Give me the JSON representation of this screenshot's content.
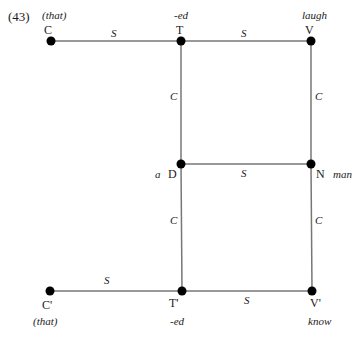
{
  "example_number": "(43)",
  "top_cutoff_text": "",
  "diagram": {
    "nodes": [
      {
        "id": "C",
        "label": "C",
        "word": "(that)",
        "x": 51,
        "y": 41
      },
      {
        "id": "T",
        "label": "T",
        "word": "-ed",
        "x": 181,
        "y": 41
      },
      {
        "id": "V",
        "label": "V",
        "word": "laugh",
        "x": 311,
        "y": 41
      },
      {
        "id": "D",
        "label": "D",
        "word": "a",
        "x": 181,
        "y": 164
      },
      {
        "id": "N",
        "label": "N",
        "word": "man",
        "x": 311,
        "y": 164
      },
      {
        "id": "C2",
        "label": "C'",
        "word": "(that)",
        "x": 50,
        "y": 291
      },
      {
        "id": "T2",
        "label": "T'",
        "word": "-ed",
        "x": 182,
        "y": 291
      },
      {
        "id": "V2",
        "label": "V'",
        "word": "know",
        "x": 312,
        "y": 291
      }
    ],
    "edges": [
      {
        "from": "C",
        "to": "T",
        "label": "S"
      },
      {
        "from": "T",
        "to": "V",
        "label": "S"
      },
      {
        "from": "T",
        "to": "D",
        "label": "C"
      },
      {
        "from": "V",
        "to": "N",
        "label": "C"
      },
      {
        "from": "D",
        "to": "N",
        "label": "S"
      },
      {
        "from": "D",
        "to": "T2",
        "label": "C"
      },
      {
        "from": "N",
        "to": "V2",
        "label": "C"
      },
      {
        "from": "C2",
        "to": "T2",
        "label": "S"
      },
      {
        "from": "T2",
        "to": "V2",
        "label": "S"
      }
    ]
  },
  "colors": {
    "line": "#777777",
    "node": "#000000",
    "text": "#1a1a1a"
  }
}
